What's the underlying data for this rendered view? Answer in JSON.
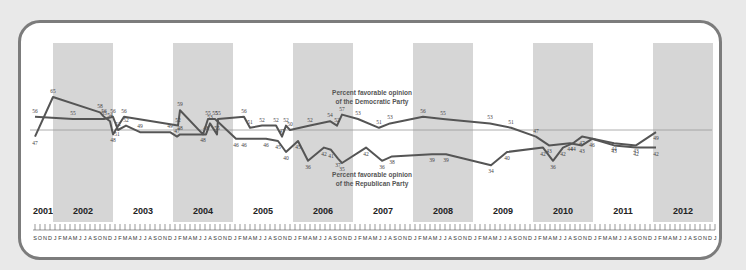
{
  "chart_data": {
    "type": "line",
    "title": "",
    "xlabel": "",
    "ylabel": "",
    "reference_line": 50,
    "grid": false,
    "years": [
      "2001",
      "2002",
      "2003",
      "2004",
      "2005",
      "2006",
      "2007",
      "2008",
      "2009",
      "2010",
      "2011",
      "2012"
    ],
    "shaded_years": [
      "2002",
      "2004",
      "2006",
      "2008",
      "2010",
      "2012"
    ],
    "month_letters": [
      "J",
      "F",
      "M",
      "A",
      "M",
      "J",
      "J",
      "A",
      "S",
      "O",
      "N",
      "D"
    ],
    "series": [
      {
        "name": "Percent favorable opinion of the Democratic Party",
        "points": [
          {
            "x": 35,
            "v": 56
          },
          {
            "x": 73,
            "v": 55
          },
          {
            "x": 104,
            "v": 55
          },
          {
            "x": 113,
            "v": 56
          },
          {
            "x": 118,
            "v": 50
          },
          {
            "x": 126,
            "v": 52
          },
          {
            "x": 140,
            "v": 49
          },
          {
            "x": 170,
            "v": 49
          },
          {
            "x": 177,
            "v": 47
          },
          {
            "x": 180,
            "v": 48
          },
          {
            "x": 206,
            "v": 48
          },
          {
            "x": 210,
            "v": 53
          },
          {
            "x": 217,
            "v": 48
          },
          {
            "x": 218,
            "v": 55
          },
          {
            "x": 244,
            "v": 56
          },
          {
            "x": 250,
            "v": 51
          },
          {
            "x": 262,
            "v": 52
          },
          {
            "x": 276,
            "v": 52
          },
          {
            "x": 282,
            "v": 47
          },
          {
            "x": 286,
            "v": 52
          },
          {
            "x": 290,
            "v": 50
          },
          {
            "x": 310,
            "v": 52
          },
          {
            "x": 330,
            "v": 54
          },
          {
            "x": 337,
            "v": 52
          },
          {
            "x": 342,
            "v": 57
          },
          {
            "x": 358,
            "v": 55
          },
          {
            "x": 379,
            "v": 51
          },
          {
            "x": 390,
            "v": 53
          },
          {
            "x": 423,
            "v": 56
          },
          {
            "x": 443,
            "v": 55
          },
          {
            "x": 490,
            "v": 53
          },
          {
            "x": 511,
            "v": 51
          },
          {
            "x": 536,
            "v": 47
          },
          {
            "x": 549,
            "v": 43
          },
          {
            "x": 570,
            "v": 44
          },
          {
            "x": 582,
            "v": 43
          },
          {
            "x": 592,
            "v": 46
          },
          {
            "x": 614,
            "v": 43
          },
          {
            "x": 636,
            "v": 42
          },
          {
            "x": 656,
            "v": 42
          }
        ],
        "data_labels": [
          "56",
          "55",
          "55",
          "56",
          "52",
          "52",
          "49",
          "49",
          "47",
          "48",
          "48",
          "53",
          "55",
          "55",
          "56",
          "51",
          "52",
          "52",
          "47",
          "52",
          "50",
          "52",
          "54",
          "52",
          "57",
          "53",
          "51",
          "53",
          "56",
          "55",
          "53",
          "51",
          "47",
          "43",
          "44",
          "43",
          "46",
          "43",
          "42",
          "42"
        ]
      },
      {
        "name": "Percent favorable opinion of the Republican Party",
        "points": [
          {
            "x": 35,
            "v": 47
          },
          {
            "x": 53,
            "v": 65
          },
          {
            "x": 100,
            "v": 58
          },
          {
            "x": 104,
            "v": 56
          },
          {
            "x": 110,
            "v": 54
          },
          {
            "x": 113,
            "v": 48
          },
          {
            "x": 117,
            "v": 51
          },
          {
            "x": 124,
            "v": 56
          },
          {
            "x": 178,
            "v": 52
          },
          {
            "x": 180,
            "v": 59
          },
          {
            "x": 203,
            "v": 48
          },
          {
            "x": 208,
            "v": 55
          },
          {
            "x": 215,
            "v": 55
          },
          {
            "x": 236,
            "v": 46
          },
          {
            "x": 244,
            "v": 46
          },
          {
            "x": 266,
            "v": 46
          },
          {
            "x": 278,
            "v": 45
          },
          {
            "x": 286,
            "v": 40
          },
          {
            "x": 298,
            "v": 45
          },
          {
            "x": 308,
            "v": 36
          },
          {
            "x": 324,
            "v": 42
          },
          {
            "x": 331,
            "v": 41
          },
          {
            "x": 338,
            "v": 37
          },
          {
            "x": 342,
            "v": 35
          },
          {
            "x": 366,
            "v": 42
          },
          {
            "x": 382,
            "v": 36
          },
          {
            "x": 392,
            "v": 38
          },
          {
            "x": 432,
            "v": 39
          },
          {
            "x": 446,
            "v": 39
          },
          {
            "x": 491,
            "v": 34
          },
          {
            "x": 507,
            "v": 40
          },
          {
            "x": 543,
            "v": 42
          },
          {
            "x": 553,
            "v": 36
          },
          {
            "x": 563,
            "v": 42
          },
          {
            "x": 573,
            "v": 44
          },
          {
            "x": 582,
            "v": 47
          },
          {
            "x": 614,
            "v": 44
          },
          {
            "x": 636,
            "v": 43
          },
          {
            "x": 656,
            "v": 49
          }
        ],
        "data_labels": [
          "47",
          "65",
          "58",
          "56",
          "54",
          "48",
          "51",
          "56",
          "52",
          "59",
          "48",
          "55",
          "55",
          "46",
          "46",
          "46",
          "45",
          "40",
          "45",
          "36",
          "42",
          "41",
          "37",
          "35",
          "42",
          "36",
          "38",
          "39",
          "39",
          "34",
          "40",
          "42",
          "36",
          "42",
          "44",
          "47",
          "44",
          "43",
          "49"
        ]
      }
    ],
    "annotations": [
      {
        "text": "Percent favorable opinion",
        "line2": "of the Democratic Party"
      },
      {
        "text": "Percent favorable opinion",
        "line2": "of the Republican Party"
      }
    ]
  },
  "labels": {
    "dem_line1": "Percent favorable opinion",
    "dem_line2": "of the Democratic Party",
    "rep_line1": "Percent favorable opinion",
    "rep_line2": "of the Republican Party"
  },
  "colors": {
    "line": "#555555",
    "band": "#d6d6d6",
    "frame": "#7c7c7c",
    "reference": "#9a9a9a"
  }
}
